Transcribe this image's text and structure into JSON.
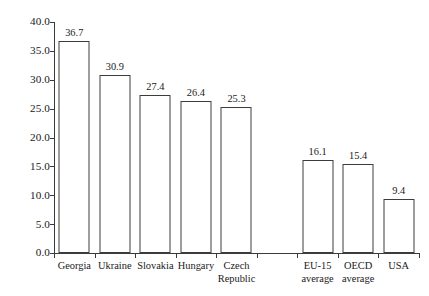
{
  "chart_data": {
    "type": "bar",
    "title": "",
    "subtitle": "",
    "xlabel": "",
    "ylabel": "",
    "ylim": [
      0.0,
      40.0
    ],
    "ytick_step": 5.0,
    "ytick_labels": [
      "0.0",
      "5.0",
      "10.0",
      "15.0",
      "20.0",
      "25.0",
      "30.0",
      "35.0",
      "40.0"
    ],
    "ytick_values": [
      0.0,
      5.0,
      10.0,
      15.0,
      20.0,
      25.0,
      30.0,
      35.0,
      40.0
    ],
    "grid": false,
    "legend": false,
    "legend_position": "none",
    "bar_fill_color": "#ffffff",
    "bar_edge_color": "#3c3c3c",
    "axis_color": "#3a3a3a",
    "background_color": "#ffffff",
    "categories": [
      "Georgia",
      "Ukraine",
      "Slovakia",
      "Hungary",
      "Czech\nRepublic",
      "",
      "EU-15\naverage",
      "OECD\naverage",
      "USA"
    ],
    "values": [
      36.7,
      30.9,
      27.4,
      26.4,
      25.3,
      null,
      16.1,
      15.4,
      9.4
    ],
    "data_labels": [
      "36.7",
      "30.9",
      "27.4",
      "26.4",
      "25.3",
      "",
      "16.1",
      "15.4",
      "9.4"
    ]
  }
}
